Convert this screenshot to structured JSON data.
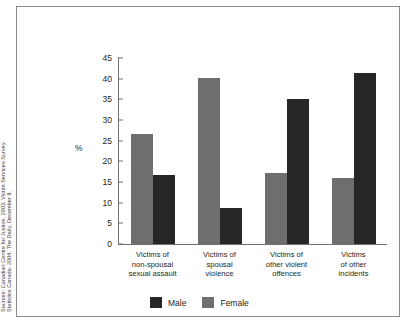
{
  "source_note": {
    "line1": "Sources: Canadian Centre for Justice. 2003. Victim Services Survey.",
    "line2": "Statistics Canada. 2004. The Daily, December 9."
  },
  "chart_data": {
    "type": "bar",
    "title": "",
    "xlabel": "",
    "ylabel": "%",
    "ylim": [
      0,
      45
    ],
    "yticks": [
      0,
      5,
      10,
      15,
      20,
      25,
      30,
      35,
      40,
      45
    ],
    "grid": false,
    "legend_position": "bottom",
    "categories": [
      "Victims of non-spousal sexual assault",
      "Victims of spousal violence",
      "Victims of other violent offences",
      "Victims of other incidents"
    ],
    "category_lines": [
      [
        "Victims of",
        "non-spousal",
        "sexual assault"
      ],
      [
        "Victims of",
        "spousal",
        "violence"
      ],
      [
        "Victims of",
        "other violent",
        "offences"
      ],
      [
        "Victims",
        "of other",
        "incidents"
      ]
    ],
    "series": [
      {
        "name": "Male",
        "color": "#262626",
        "values": [
          16.8,
          8.8,
          35.0,
          41.3
        ]
      },
      {
        "name": "Female",
        "color": "#6e6e6e",
        "values": [
          26.7,
          40.2,
          17.1,
          16.0
        ]
      }
    ]
  }
}
